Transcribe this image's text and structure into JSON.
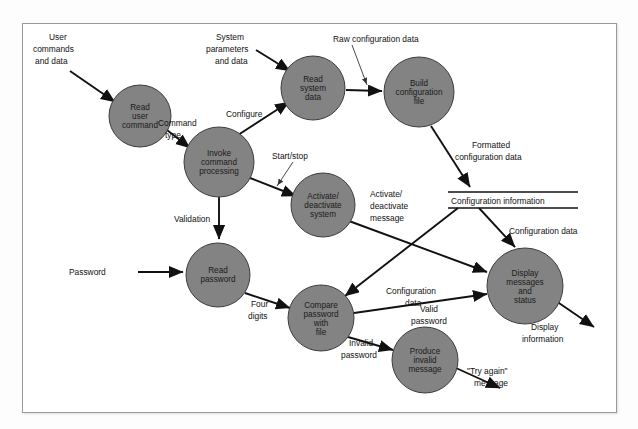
{
  "diagram": {
    "type": "data-flow-diagram",
    "frame": {
      "border_color": "#9a9a9a",
      "background": "#ffffff"
    },
    "style": {
      "process_fill": "#838383",
      "process_stroke": "#3c3c3c",
      "flow_color": "#111111",
      "text_color": "#111111"
    },
    "processes": [
      {
        "id": "read-user-command",
        "label_lines": [
          "Read",
          "user",
          "command"
        ],
        "cx": 140,
        "cy": 116,
        "r": 31
      },
      {
        "id": "invoke-command-processing",
        "label_lines": [
          "Invoke",
          "command",
          "processing"
        ],
        "cx": 219,
        "cy": 162,
        "r": 35
      },
      {
        "id": "read-system-data",
        "label_lines": [
          "Read",
          "system",
          "data"
        ],
        "cx": 313,
        "cy": 88,
        "r": 32
      },
      {
        "id": "build-configuration-file",
        "label_lines": [
          "Build",
          "configuration",
          "file"
        ],
        "cx": 419,
        "cy": 92,
        "r": 35
      },
      {
        "id": "activate-deactivate-system",
        "label_lines": [
          "Activate/",
          "deactivate",
          "system"
        ],
        "cx": 323,
        "cy": 205,
        "r": 32
      },
      {
        "id": "read-password",
        "label_lines": [
          "Read",
          "password"
        ],
        "cx": 218,
        "cy": 275,
        "r": 32
      },
      {
        "id": "compare-password-with-file",
        "label_lines": [
          "Compare",
          "password",
          "with",
          "file"
        ],
        "cx": 321,
        "cy": 318,
        "r": 33
      },
      {
        "id": "produce-invalid-message",
        "label_lines": [
          "Produce",
          "invalid",
          "message"
        ],
        "cx": 425,
        "cy": 360,
        "r": 33
      },
      {
        "id": "display-messages-and-status",
        "label_lines": [
          "Display",
          "messages",
          "and",
          "status"
        ],
        "cx": 525,
        "cy": 286,
        "r": 38
      }
    ],
    "data_stores": [
      {
        "id": "configuration-information",
        "label": "Configuration information",
        "x": 448,
        "y": 192,
        "width": 130
      }
    ],
    "flows": [
      {
        "id": "user-commands-and-data",
        "label_lines": [
          "User",
          "commands",
          "and data"
        ]
      },
      {
        "id": "command-type",
        "label_lines": [
          "Command",
          "type"
        ]
      },
      {
        "id": "system-parameters-and-data",
        "label_lines": [
          "System",
          "parameters",
          "and data"
        ]
      },
      {
        "id": "configure",
        "label_lines": [
          "Configure"
        ]
      },
      {
        "id": "raw-configuration-data",
        "label_lines": [
          "Raw configuration data"
        ]
      },
      {
        "id": "formatted-configuration-data",
        "label_lines": [
          "Formatted",
          "configuration data"
        ]
      },
      {
        "id": "start-stop",
        "label_lines": [
          "Start/stop"
        ]
      },
      {
        "id": "activate-deactivate-message",
        "label_lines": [
          "Activate/",
          "deactivate",
          "message"
        ]
      },
      {
        "id": "configuration-data-store-to-display",
        "label_lines": [
          "Configuration data"
        ]
      },
      {
        "id": "configuration-data-store-to-compare",
        "label_lines": [
          "Configuration",
          "data"
        ]
      },
      {
        "id": "validation",
        "label_lines": [
          "Validation"
        ]
      },
      {
        "id": "password",
        "label_lines": [
          "Password"
        ]
      },
      {
        "id": "four-digits",
        "label_lines": [
          "Four",
          "digits"
        ]
      },
      {
        "id": "valid-password",
        "label_lines": [
          "Valid",
          "password"
        ]
      },
      {
        "id": "invalid-password",
        "label_lines": [
          "Invalid",
          "password"
        ]
      },
      {
        "id": "try-again-message",
        "label_lines": [
          "\"Try again\"",
          "message"
        ]
      },
      {
        "id": "display-information",
        "label_lines": [
          "Display",
          "information"
        ]
      }
    ]
  }
}
